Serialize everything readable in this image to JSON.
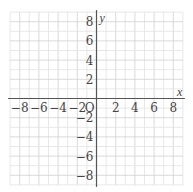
{
  "chart_data": {
    "type": "coordinate-grid",
    "title": "",
    "xlabel": "x",
    "ylabel": "y",
    "origin_label": "O",
    "xlim": [
      -9,
      9
    ],
    "ylim": [
      -9,
      9
    ],
    "grid": true,
    "grid_step": 1,
    "x_ticks": [
      -8,
      -6,
      -4,
      -2,
      2,
      4,
      6,
      8
    ],
    "y_ticks": [
      -8,
      -6,
      -4,
      -2,
      2,
      4,
      6,
      8
    ],
    "x_tick_labels": [
      "−8",
      "−6",
      "−4",
      "−2",
      "2",
      "4",
      "6",
      "8"
    ],
    "y_tick_labels": [
      "−8",
      "−6",
      "−4",
      "−2",
      "2",
      "4",
      "6",
      "8"
    ],
    "series": []
  },
  "colors": {
    "grid_minor": "#e2e2e2",
    "grid_major": "#cfcfcf",
    "axis": "#555555",
    "text": "#444444"
  }
}
